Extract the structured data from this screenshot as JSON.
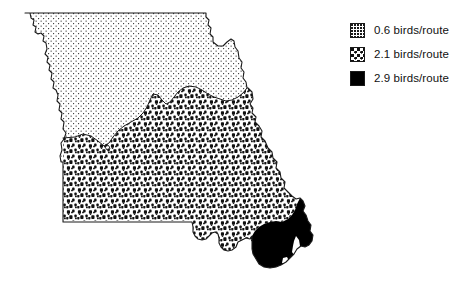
{
  "figure": {
    "kind": "choropleth-map",
    "unit": "birds/route"
  },
  "map": {
    "name": "missouri-state-map",
    "regions": [
      {
        "id": "north",
        "name": "northern-region",
        "pattern": "fine-stipple",
        "value": "0.6",
        "unit": "birds/route"
      },
      {
        "id": "south-central",
        "name": "south-central-region",
        "pattern": "coarse-stipple",
        "value": "2.1",
        "unit": "birds/route"
      },
      {
        "id": "bootheel",
        "name": "southeast-bootheel-region",
        "pattern": "solid-black",
        "value": "2.9",
        "unit": "birds/route"
      }
    ]
  },
  "legend": {
    "name": "density-legend",
    "items": [
      {
        "swatch": "fine-stipple",
        "label": "0.6 birds/route",
        "value": "0.6"
      },
      {
        "swatch": "coarse-stipple",
        "label": "2.1 birds/route",
        "value": "2.1"
      },
      {
        "swatch": "solid-black",
        "label": "2.9 birds/route",
        "value": "2.9"
      }
    ]
  },
  "colors": {
    "outline": "#1a1a1a",
    "stipple_dot": "#111111",
    "solid_fill": "#000000",
    "background": "#ffffff"
  }
}
